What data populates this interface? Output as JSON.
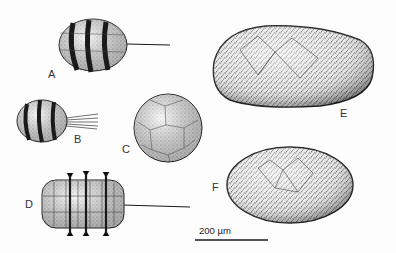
{
  "figure": {
    "panels": [
      {
        "id": "A",
        "label": "A",
        "description": "barrel-shaped specimen with dark transverse bands and long thin filament"
      },
      {
        "id": "B",
        "label": "B",
        "description": "small banded specimen with tuft of filaments"
      },
      {
        "id": "C",
        "label": "C",
        "description": "spherical specimen with polygonal surface reticulation"
      },
      {
        "id": "D",
        "label": "D",
        "description": "segmented specimen with cellular plates, tufted bands and long filament"
      },
      {
        "id": "E",
        "label": "E",
        "description": "large elongate ovoid specimen densely covered in fine hairs"
      },
      {
        "id": "F",
        "label": "F",
        "description": "ovoid specimen densely covered in fine hairs"
      }
    ],
    "scale_bar": {
      "label": "200 µm",
      "value": 200,
      "unit": "µm"
    },
    "colors": {
      "ink": "#1a1a1a",
      "stipple": "#555555",
      "paper": "#fdfdfd"
    }
  }
}
